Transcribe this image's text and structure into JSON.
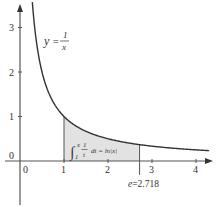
{
  "chart_data": {
    "type": "line",
    "title": "",
    "xlabel": "",
    "ylabel": "",
    "xlim": [
      -0.1,
      4.3
    ],
    "ylim": [
      -0.4,
      3.5
    ],
    "grid": false,
    "legend": null,
    "x_ticks": [
      "0",
      "1",
      "2",
      "3",
      "4"
    ],
    "y_ticks": [
      "0",
      "1",
      "2",
      "3"
    ],
    "series": [
      {
        "name": "y = 1/x",
        "function": "1/x",
        "x_range": [
          0.28,
          4.3
        ],
        "x": [
          0.28,
          0.35,
          0.5,
          0.75,
          1,
          1.5,
          2,
          2.718,
          3,
          3.5,
          4,
          4.3
        ],
        "y": [
          3.57,
          2.86,
          2.0,
          1.33,
          1.0,
          0.667,
          0.5,
          0.368,
          0.333,
          0.286,
          0.25,
          0.233
        ]
      }
    ],
    "shaded_region": {
      "x_from": 1,
      "x_to": 2.718,
      "under": "y = 1/x",
      "fill": "#e2e2e2"
    },
    "annotations": [
      {
        "text": "y = 1/x",
        "x": 1.1,
        "y": 2.85
      },
      {
        "text": "∫₁ˣ (1/t) dt = ln|x|",
        "x": 1.15,
        "y": 0.3
      },
      {
        "text": "e = 2.718",
        "x": 2.718,
        "y": -0.35
      }
    ]
  },
  "labels": {
    "curve_label_y": "y",
    "curve_label_eq": "=",
    "curve_label_num": "1",
    "curve_label_den": "x",
    "integral_text_right": "dt = ln|x|",
    "integral_upper": "x",
    "integral_lower": "1",
    "integral_frac_num": "1",
    "integral_frac_den": "t",
    "e_label": "e=2.718",
    "x_ticks": [
      "0",
      "1",
      "2",
      "3",
      "4"
    ],
    "y_ticks": [
      "0",
      "1",
      "2",
      "3"
    ]
  },
  "colors": {
    "axis": "#555555",
    "curve": "#333333",
    "fill": "#e2e2e2",
    "text": "#333333"
  }
}
